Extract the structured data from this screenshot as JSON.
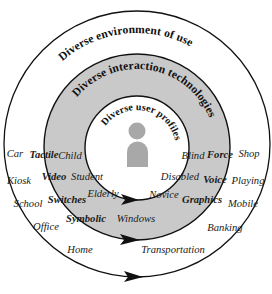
{
  "figure": {
    "background": "#ffffff",
    "outline_color": "#111111",
    "ring_fill_gray": "#c9c9c9",
    "inner_fill": "#ffffff",
    "person_icon_color": "#a8a8a8"
  },
  "rings": [
    {
      "id": "outer",
      "name": "diverse-environment-of-use",
      "label": "Diverse environment of use",
      "fill": "#ffffff",
      "radius": 133
    },
    {
      "id": "middle",
      "name": "diverse-interaction-technologies",
      "label": "Diverse interaction technologies",
      "fill": "#c9c9c9",
      "radius": 93
    },
    {
      "id": "inner",
      "name": "diverse-user-profiles",
      "label": "Diverse user profiles",
      "fill": "#ffffff",
      "radius": 52
    }
  ],
  "user_profiles": {
    "ring": "inner",
    "items": [
      {
        "label": "Child",
        "x": 70,
        "y": 159
      },
      {
        "label": "Blind",
        "x": 193,
        "y": 159
      },
      {
        "label": "Student",
        "x": 85,
        "y": 180
      },
      {
        "label": "Disabled",
        "x": 178,
        "y": 180
      },
      {
        "label": "Elderly",
        "x": 101,
        "y": 197
      },
      {
        "label": "Novice",
        "x": 163,
        "y": 198
      },
      {
        "label": "Windows",
        "x": 133,
        "y": 222
      }
    ]
  },
  "interaction_technologies": {
    "ring": "middle",
    "items": [
      {
        "label": "Tactile",
        "x": 43,
        "y": 158
      },
      {
        "label": "Force",
        "x": 219,
        "y": 158
      },
      {
        "label": "Video",
        "x": 53,
        "y": 180
      },
      {
        "label": "Voice",
        "x": 215,
        "y": 183
      },
      {
        "label": "Switches",
        "x": 63,
        "y": 203
      },
      {
        "label": "Graphics",
        "x": 200,
        "y": 203
      },
      {
        "label": "Symbolic",
        "x": 82,
        "y": 222
      }
    ]
  },
  "environments_of_use": {
    "ring": "outer",
    "items": [
      {
        "label": "Car",
        "x": 14,
        "y": 157
      },
      {
        "label": "Shop",
        "x": 248,
        "y": 157
      },
      {
        "label": "Kiosk",
        "x": 17,
        "y": 184
      },
      {
        "label": "Playing",
        "x": 248,
        "y": 184
      },
      {
        "label": "School",
        "x": 25,
        "y": 207
      },
      {
        "label": "Mobile",
        "x": 243,
        "y": 207
      },
      {
        "label": "Office",
        "x": 43,
        "y": 230
      },
      {
        "label": "Banking",
        "x": 224,
        "y": 231
      },
      {
        "label": "Home",
        "x": 78,
        "y": 253
      },
      {
        "label": "Transportation",
        "x": 170,
        "y": 253
      }
    ]
  },
  "arrows": [
    {
      "name": "inner-circle-arrowhead",
      "x": 133,
      "y": 200,
      "ring": "inner"
    },
    {
      "name": "middle-ring-arrowhead",
      "x": 133,
      "y": 240,
      "ring": "middle"
    },
    {
      "name": "outer-circle-arrowhead",
      "x": 136,
      "y": 277,
      "ring": "outer"
    }
  ],
  "person_icon": {
    "name": "person-icon",
    "head_cx": 137,
    "head_cy": 131,
    "head_r": 8.5,
    "body_x": 127,
    "body_y": 141,
    "body_w": 21,
    "body_h": 26
  }
}
